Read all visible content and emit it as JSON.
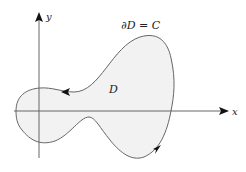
{
  "diagram": {
    "type": "region-with-boundary",
    "axes": {
      "x_label": "x",
      "y_label": "y"
    },
    "region_label": "D",
    "boundary_label": "∂D = C",
    "orientation": "counterclockwise",
    "colors": {
      "region_fill": "#f2f2f2",
      "curve": "#555555",
      "axes": "#555555",
      "arrowheads": "#111111"
    }
  }
}
